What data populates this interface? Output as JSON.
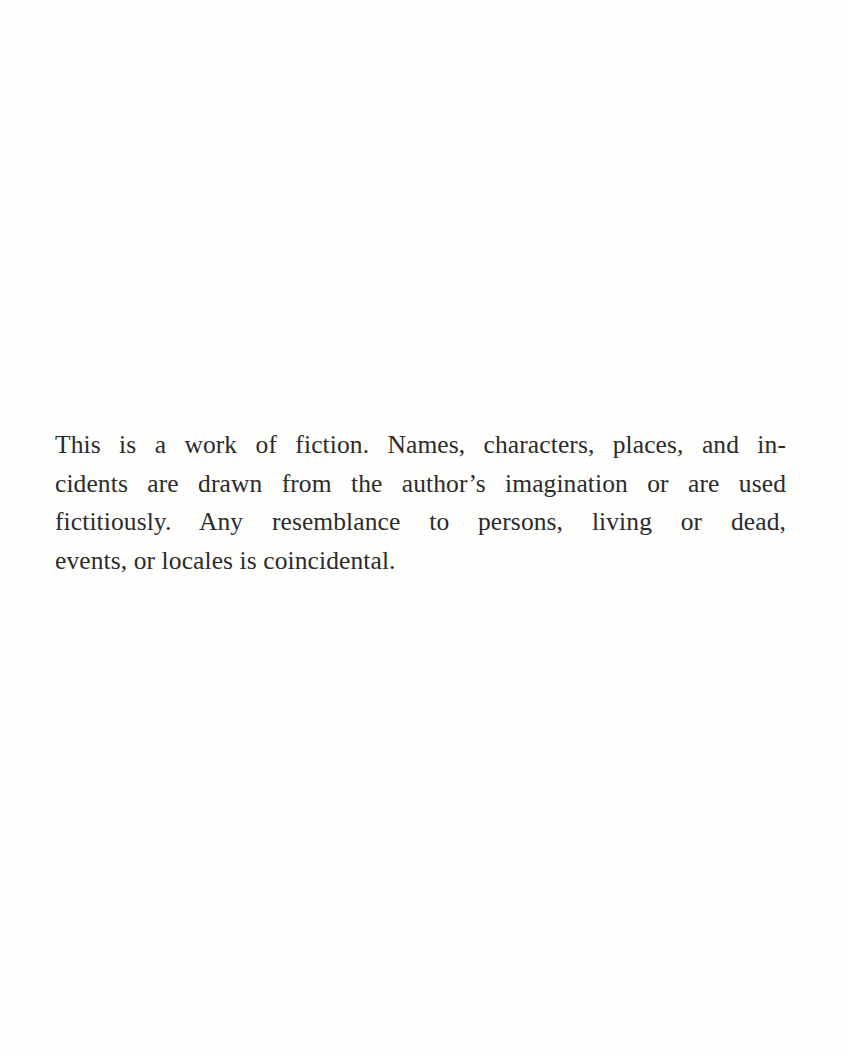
{
  "page": {
    "type": "book-disclaimer-page",
    "disclaimer": {
      "full_text": "This is a work of fiction. Names, characters, places, and incidents are drawn from the author’s imagination or are used fictitiously. Any resemblance to persons, living or dead, events, or locales is coincidental.",
      "lines": [
        "This is a work of fiction. Names, characters, places, and in-",
        "cidents are drawn from the author’s imagination or are used",
        "fictitiously. Any resemblance to persons, living or dead,",
        "events, or locales is coincidental."
      ]
    },
    "colors": {
      "background": "#fefefd",
      "text": "#2b2b2b"
    }
  }
}
